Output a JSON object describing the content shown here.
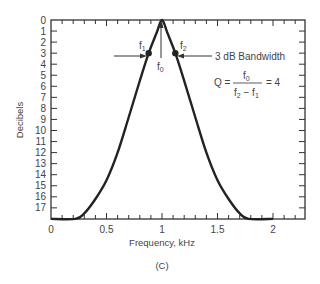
{
  "chart_data": {
    "type": "line",
    "title": "",
    "xlabel": "Frequency, kHz",
    "ylabel": "Decibels",
    "caption": "(C)",
    "xlim": [
      0,
      2.3
    ],
    "ylim": [
      18,
      0
    ],
    "y_inverted": true,
    "x_ticks": [
      0,
      0.5,
      1,
      1.5,
      2
    ],
    "x_tick_labels": [
      "0",
      "0.5",
      "1",
      "1.5",
      "2"
    ],
    "y_ticks": [
      0,
      1,
      2,
      3,
      4,
      5,
      6,
      7,
      8,
      9,
      10,
      11,
      12,
      13,
      14,
      15,
      16,
      17
    ],
    "y_tick_labels": [
      "0",
      "1",
      "2",
      "3",
      "4",
      "5",
      "6",
      "7",
      "8",
      "9",
      "10",
      "11",
      "12",
      "13",
      "14",
      "15",
      "16",
      "17"
    ],
    "grid": false,
    "series": [
      {
        "name": "Bandpass response",
        "x": [
          0,
          0.22,
          0.3,
          0.4,
          0.5,
          0.6,
          0.7,
          0.8,
          0.88,
          0.95,
          1.0,
          1.05,
          1.12,
          1.2,
          1.3,
          1.4,
          1.5,
          1.6,
          1.7,
          1.78,
          2.0
        ],
        "y": [
          18,
          18,
          17.5,
          16.2,
          14.5,
          12,
          8.8,
          5.5,
          3,
          1.2,
          0,
          1.2,
          3,
          5.5,
          8.8,
          12,
          14.5,
          16.2,
          17.5,
          18,
          18
        ]
      }
    ],
    "markers": [
      {
        "label": "f1",
        "x": 0.88,
        "y": 3
      },
      {
        "label": "f2",
        "x": 1.12,
        "y": 3
      }
    ],
    "annotations": {
      "f0_label": "f",
      "f0_sub": "0",
      "f1_label": "f",
      "f1_sub": "1",
      "f2_label": "f",
      "f2_sub": "2",
      "bandwidth": "3 dB Bandwidth",
      "q_lhs": "Q =",
      "q_num": "f",
      "q_num_sub": "0",
      "q_den_a": "f",
      "q_den_a_sub": "2",
      "q_den_minus": " − f",
      "q_den_b_sub": "1",
      "q_rhs": "= 4"
    }
  }
}
